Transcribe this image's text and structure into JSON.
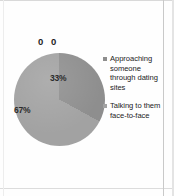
{
  "chart_data": {
    "type": "pie",
    "title": "",
    "subtitle": "",
    "xlabel": "",
    "ylabel": "",
    "grid": false,
    "legend_position": "right",
    "categories": [
      "Approaching someone through dating sites",
      "Talking to them face-to-face"
    ],
    "values": [
      33,
      67
    ],
    "data_labels": [
      "33%",
      "67%"
    ],
    "colors": [
      "#8e8e8e",
      "#a2a2a2"
    ],
    "annotations": [
      {
        "name": "top-label",
        "text": "0 0"
      }
    ]
  },
  "legend": {
    "items": [
      {
        "label": "Approaching someone through dating sites",
        "marker": "square-marker-icon",
        "color": "#8e8e8e"
      },
      {
        "label": "Talking to them face-to-face",
        "marker": "square-marker-icon",
        "color": "#a2a2a2"
      }
    ]
  },
  "slices": {
    "label_0": "33%",
    "label_1": "67%"
  },
  "annotation": {
    "top_text": "0 0"
  }
}
